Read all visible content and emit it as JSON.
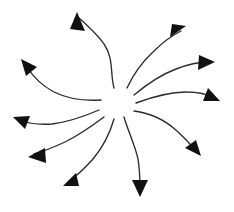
{
  "canvas": {
    "width": 234,
    "height": 212,
    "background_color": "#ffffff"
  },
  "diagram": {
    "type": "radial-arrow-burst",
    "center": {
      "x": 117,
      "y": 105
    },
    "hub_radius": 20,
    "arrow_count": 10,
    "stroke_color": "#2b2b2b",
    "head_color": "#111111",
    "stroke_width": 1.35,
    "rotation_sense": "counter-clockwise"
  },
  "arrows": [
    {
      "id": "arrow-north",
      "label": "north",
      "direction_degrees": 90,
      "tail": {
        "x": 114,
        "y": 88
      },
      "tip": {
        "x": 77,
        "y": 14
      },
      "head_angle_degrees": -76,
      "path": "M 114 88 C 110 74 114 58 104 44 C 98 35 88 26 79 18",
      "head_points": "77,12 85,31 70,29"
    },
    {
      "id": "arrow-northeast",
      "label": "northeast",
      "direction_degrees": 40,
      "tail": {
        "x": 127,
        "y": 88
      },
      "tip": {
        "x": 185,
        "y": 27
      },
      "head_angle_degrees": 40,
      "path": "M 127 88 C 133 75 142 62 154 51 C 163 42 173 35 181 31",
      "head_points": "186,26 170,37 172,24"
    },
    {
      "id": "arrow-east-upper",
      "label": "east-upper",
      "direction_degrees": 12,
      "tail": {
        "x": 134,
        "y": 95
      },
      "tip": {
        "x": 214,
        "y": 62
      },
      "head_angle_degrees": 8,
      "path": "M 134 95 C 146 85 160 75 176 69 C 189 64 200 62 208 62",
      "head_points": "215,62 198,70 199,55"
    },
    {
      "id": "arrow-east-lower",
      "label": "east-lower",
      "direction_degrees": -10,
      "tail": {
        "x": 136,
        "y": 103
      },
      "tip": {
        "x": 219,
        "y": 101
      },
      "head_angle_degrees": 22,
      "path": "M 136 103 C 152 97 170 92 186 92 C 199 92 209 95 214 98",
      "head_points": "220,101 203,101 208,88"
    },
    {
      "id": "arrow-southeast",
      "label": "southeast",
      "direction_degrees": -38,
      "tail": {
        "x": 134,
        "y": 111
      },
      "tip": {
        "x": 200,
        "y": 155
      },
      "head_angle_degrees": 50,
      "path": "M 134 111 C 150 113 165 120 177 131 C 186 139 192 146 196 151",
      "head_points": "201,156 185,148 196,140"
    },
    {
      "id": "arrow-south",
      "label": "south",
      "direction_degrees": -85,
      "tail": {
        "x": 124,
        "y": 117
      },
      "tip": {
        "x": 140,
        "y": 196
      },
      "head_angle_degrees": 80,
      "path": "M 124 117 C 128 131 135 145 138 159 C 140 171 140 182 140 190",
      "head_points": "140,197 132,180 148,180"
    },
    {
      "id": "arrow-southwest",
      "label": "southwest",
      "direction_degrees": -145,
      "tail": {
        "x": 114,
        "y": 119
      },
      "tip": {
        "x": 64,
        "y": 185
      },
      "head_angle_degrees": 145,
      "path": "M 114 119 C 110 133 103 147 93 159 C 83 170 74 178 68 182",
      "head_points": "63,186 76,173 79,186"
    },
    {
      "id": "arrow-west-lower",
      "label": "west-lower",
      "direction_degrees": 188,
      "tail": {
        "x": 104,
        "y": 117
      },
      "tip": {
        "x": 29,
        "y": 156
      },
      "head_angle_degrees": 186,
      "path": "M 104 117 C 92 126 79 135 65 142 C 52 148 41 152 34 154",
      "head_points": "28,157 45,148 46,163"
    },
    {
      "id": "arrow-west-upper",
      "label": "west-upper",
      "direction_degrees": 168,
      "tail": {
        "x": 99,
        "y": 110
      },
      "tip": {
        "x": 14,
        "y": 116
      },
      "head_angle_degrees": 198,
      "path": "M 99 110 C 85 116 68 122 52 124 C 38 125 27 123 20 120",
      "head_points": "13,117 30,116 25,129"
    },
    {
      "id": "arrow-northwest",
      "label": "northwest",
      "direction_degrees": 138,
      "tail": {
        "x": 101,
        "y": 100
      },
      "tip": {
        "x": 22,
        "y": 60
      },
      "head_angle_degrees": 153,
      "path": "M 101 100 C 85 101 68 99 54 92 C 41 85 32 75 27 67",
      "head_points": "21,59 37,67 26,76"
    }
  ]
}
